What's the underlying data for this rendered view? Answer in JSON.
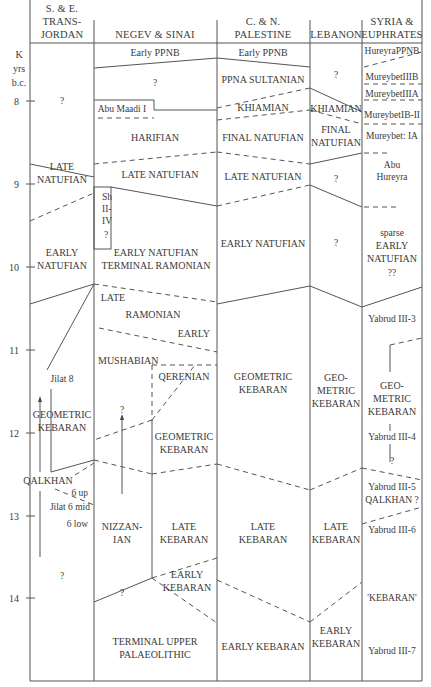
{
  "axis": {
    "unit_lines": [
      "K",
      "yrs",
      "b.c."
    ],
    "ticks": [
      {
        "label": "8",
        "y": 101
      },
      {
        "label": "9",
        "y": 184
      },
      {
        "label": "10",
        "y": 267
      },
      {
        "label": "11",
        "y": 350
      },
      {
        "label": "12",
        "y": 433
      },
      {
        "label": "13",
        "y": 516
      },
      {
        "label": "14",
        "y": 598
      }
    ]
  },
  "columns": [
    {
      "id": "transjordan",
      "header": [
        "S. & E.",
        "TRANS-",
        "JORDAN"
      ],
      "cx": 62
    },
    {
      "id": "negev-sinai",
      "header": [
        "NEGEV & SINAI"
      ],
      "cx": 155
    },
    {
      "id": "palestine",
      "header": [
        "C. & N.",
        "PALESTINE"
      ],
      "cx": 263
    },
    {
      "id": "lebanon",
      "header": [
        "LEBANON"
      ],
      "cx": 336
    },
    {
      "id": "syria-euphrates",
      "header": [
        "SYRIA &",
        "EUPHRATES"
      ],
      "cx": 392
    }
  ],
  "labels": [
    {
      "col": "transjordan",
      "lines": [
        "?"
      ],
      "x": 62,
      "y": 104,
      "cls": "sm"
    },
    {
      "col": "transjordan",
      "lines": [
        "LATE",
        "NATUFIAN"
      ],
      "x": 62,
      "y": 170
    },
    {
      "col": "transjordan",
      "lines": [
        "EARLY",
        "NATUFIAN"
      ],
      "x": 62,
      "y": 256
    },
    {
      "col": "transjordan",
      "lines": [
        "Jilat 8"
      ],
      "x": 62,
      "y": 382,
      "cls": "sm"
    },
    {
      "col": "transjordan",
      "lines": [
        "GEOMETRIC",
        "KEBARAN"
      ],
      "x": 62,
      "y": 418
    },
    {
      "col": "transjordan",
      "lines": [
        "QALKHAN"
      ],
      "x": 48,
      "y": 484
    },
    {
      "col": "transjordan",
      "lines": [
        "6 up"
      ],
      "x": 88,
      "y": 496,
      "cls": "sm",
      "anchor": "end"
    },
    {
      "col": "transjordan",
      "lines": [
        "Jilat 6 mid"
      ],
      "x": 90,
      "y": 510,
      "cls": "sm",
      "anchor": "end"
    },
    {
      "col": "transjordan",
      "lines": [
        "6 low"
      ],
      "x": 88,
      "y": 527,
      "cls": "sm",
      "anchor": "end"
    },
    {
      "col": "transjordan",
      "lines": [
        "?"
      ],
      "x": 62,
      "y": 579,
      "cls": "sm"
    },
    {
      "col": "negev-sinai",
      "lines": [
        "Early PPNB"
      ],
      "x": 155,
      "y": 56
    },
    {
      "col": "negev-sinai",
      "lines": [
        "?"
      ],
      "x": 155,
      "y": 86,
      "cls": "sm"
    },
    {
      "col": "negev-sinai",
      "lines": [
        "Abu Maadi I"
      ],
      "x": 122,
      "y": 112,
      "cls": "sm"
    },
    {
      "col": "negev-sinai",
      "lines": [
        "HARIFIAN"
      ],
      "x": 155,
      "y": 141
    },
    {
      "col": "negev-sinai",
      "lines": [
        "LATE NATUFIAN"
      ],
      "x": 160,
      "y": 178
    },
    {
      "col": "negev-sinai",
      "lines": [
        "Sh",
        "II-",
        "IV"
      ],
      "x": 102,
      "y": 200,
      "cls": "sm",
      "anchor": "start"
    },
    {
      "col": "negev-sinai",
      "lines": [
        "?"
      ],
      "x": 106,
      "y": 238,
      "cls": "sm"
    },
    {
      "col": "negev-sinai",
      "lines": [
        "EARLY NATUFIAN",
        "TERMINAL RAMONIAN"
      ],
      "x": 156,
      "y": 256
    },
    {
      "col": "negev-sinai",
      "lines": [
        "LATE"
      ],
      "x": 113,
      "y": 301
    },
    {
      "col": "negev-sinai",
      "lines": [
        "RAMONIAN"
      ],
      "x": 153,
      "y": 318
    },
    {
      "col": "negev-sinai",
      "lines": [
        "EARLY"
      ],
      "x": 210,
      "y": 337,
      "anchor": "end"
    },
    {
      "col": "negev-sinai",
      "lines": [
        "MUSHABIAN"
      ],
      "x": 98,
      "y": 364,
      "anchor": "start"
    },
    {
      "col": "negev-sinai",
      "lines": [
        "QERENIAN"
      ],
      "x": 184,
      "y": 380
    },
    {
      "col": "negev-sinai",
      "lines": [
        "?"
      ],
      "x": 122,
      "y": 413,
      "cls": "sm"
    },
    {
      "col": "negev-sinai",
      "lines": [
        "GEOMETRIC",
        "KEBARAN"
      ],
      "x": 184,
      "y": 440
    },
    {
      "col": "negev-sinai",
      "lines": [
        "NIZZAN-",
        "IAN"
      ],
      "x": 122,
      "y": 530
    },
    {
      "col": "negev-sinai",
      "lines": [
        "LATE",
        "KEBARAN"
      ],
      "x": 184,
      "y": 530
    },
    {
      "col": "negev-sinai",
      "lines": [
        "?"
      ],
      "x": 122,
      "y": 596,
      "cls": "sm"
    },
    {
      "col": "negev-sinai",
      "lines": [
        "EARLY",
        "KEBARAN"
      ],
      "x": 187,
      "y": 578
    },
    {
      "col": "negev-sinai",
      "lines": [
        "TERMINAL UPPER",
        "PALAEOLITHIC"
      ],
      "x": 155,
      "y": 645
    },
    {
      "col": "palestine",
      "lines": [
        "Early PPNB"
      ],
      "x": 263,
      "y": 56
    },
    {
      "col": "palestine",
      "lines": [
        "PPNA SULTANIAN"
      ],
      "x": 263,
      "y": 83
    },
    {
      "col": "palestine",
      "lines": [
        "KHIAMIAN"
      ],
      "x": 263,
      "y": 111
    },
    {
      "col": "palestine",
      "lines": [
        "FINAL NATUFIAN"
      ],
      "x": 263,
      "y": 141
    },
    {
      "col": "palestine",
      "lines": [
        "LATE NATUFIAN"
      ],
      "x": 263,
      "y": 180
    },
    {
      "col": "palestine",
      "lines": [
        "EARLY NATUFIAN"
      ],
      "x": 263,
      "y": 247
    },
    {
      "col": "palestine",
      "lines": [
        "GEOMETRIC",
        "KEBARAN"
      ],
      "x": 263,
      "y": 380
    },
    {
      "col": "palestine",
      "lines": [
        "LATE",
        "KEBARAN"
      ],
      "x": 263,
      "y": 530
    },
    {
      "col": "palestine",
      "lines": [
        "EARLY KEBARAN"
      ],
      "x": 263,
      "y": 650
    },
    {
      "col": "lebanon",
      "lines": [
        "?"
      ],
      "x": 336,
      "y": 78,
      "cls": "sm"
    },
    {
      "col": "lebanon",
      "lines": [
        "KHIAMIAN"
      ],
      "x": 336,
      "y": 112
    },
    {
      "col": "lebanon",
      "lines": [
        "FINAL",
        "NATUFIAN"
      ],
      "x": 336,
      "y": 133
    },
    {
      "col": "lebanon",
      "lines": [
        "?"
      ],
      "x": 336,
      "y": 182,
      "cls": "sm"
    },
    {
      "col": "lebanon",
      "lines": [
        "?"
      ],
      "x": 336,
      "y": 246,
      "cls": "sm"
    },
    {
      "col": "lebanon",
      "lines": [
        "GEO-",
        "METRIC",
        "KEBARAN"
      ],
      "x": 336,
      "y": 381
    },
    {
      "col": "lebanon",
      "lines": [
        "LATE",
        "KEBARAN"
      ],
      "x": 336,
      "y": 530
    },
    {
      "col": "lebanon",
      "lines": [
        "EARLY",
        "KEBARAN"
      ],
      "x": 336,
      "y": 634
    },
    {
      "col": "syria-euphrates",
      "lines": [
        "HureyraPPNB"
      ],
      "x": 392,
      "y": 54,
      "cls": "sm"
    },
    {
      "col": "syria-euphrates",
      "lines": [
        "MureybetIIIB"
      ],
      "x": 392,
      "y": 80,
      "cls": "sm"
    },
    {
      "col": "syria-euphrates",
      "lines": [
        "MureybetIIIA"
      ],
      "x": 392,
      "y": 97,
      "cls": "sm"
    },
    {
      "col": "syria-euphrates",
      "lines": [
        "MureybetIB-II"
      ],
      "x": 392,
      "y": 118,
      "cls": "sm"
    },
    {
      "col": "syria-euphrates",
      "lines": [
        "Mureybet: IA"
      ],
      "x": 392,
      "y": 139,
      "cls": "sm"
    },
    {
      "col": "syria-euphrates",
      "lines": [
        "Abu",
        "Hureyra"
      ],
      "x": 392,
      "y": 168,
      "cls": "sm"
    },
    {
      "col": "syria-euphrates",
      "lines": [
        "sparse"
      ],
      "x": 392,
      "y": 236,
      "cls": "sm"
    },
    {
      "col": "syria-euphrates",
      "lines": [
        "EARLY",
        "NATUFIAN"
      ],
      "x": 392,
      "y": 249
    },
    {
      "col": "syria-euphrates",
      "lines": [
        "??"
      ],
      "x": 392,
      "y": 276,
      "cls": "sm"
    },
    {
      "col": "syria-euphrates",
      "lines": [
        "Yabrud III-3"
      ],
      "x": 392,
      "y": 322,
      "cls": "sm"
    },
    {
      "col": "syria-euphrates",
      "lines": [
        "GEO-",
        "METRIC",
        "KEBARAN"
      ],
      "x": 392,
      "y": 389
    },
    {
      "col": "syria-euphrates",
      "lines": [
        "Yabrud III-4"
      ],
      "x": 392,
      "y": 440,
      "cls": "sm"
    },
    {
      "col": "syria-euphrates",
      "lines": [
        "?"
      ],
      "x": 392,
      "y": 464,
      "cls": "sm"
    },
    {
      "col": "syria-euphrates",
      "lines": [
        "Yabrud III-5"
      ],
      "x": 392,
      "y": 490,
      "cls": "sm"
    },
    {
      "col": "syria-euphrates",
      "lines": [
        "QALKHAN ?"
      ],
      "x": 392,
      "y": 503,
      "cls": "sm"
    },
    {
      "col": "syria-euphrates",
      "lines": [
        "Yabrud III-6"
      ],
      "x": 392,
      "y": 533,
      "cls": "sm"
    },
    {
      "col": "syria-euphrates",
      "lines": [
        "'KEBARAN'"
      ],
      "x": 392,
      "y": 601,
      "cls": "sm"
    },
    {
      "col": "syria-euphrates",
      "lines": [
        "Yabrud III-7"
      ],
      "x": 392,
      "y": 654,
      "cls": "sm"
    }
  ]
}
